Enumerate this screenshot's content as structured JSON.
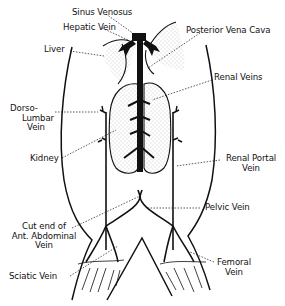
{
  "diagram": {
    "colors": {
      "ink": "#111111",
      "background": "#ffffff",
      "stipple": "#9a9a9a"
    },
    "labels": [
      {
        "id": "sinus-venosus",
        "lines": [
          "Sinus Venosus"
        ]
      },
      {
        "id": "hepatic-vein",
        "lines": [
          "Hepatic Vein"
        ]
      },
      {
        "id": "posterior-vena-cava",
        "lines": [
          "Posterior Vena Cava"
        ]
      },
      {
        "id": "liver",
        "lines": [
          "Liver"
        ]
      },
      {
        "id": "renal-veins",
        "lines": [
          "Renal Veins"
        ]
      },
      {
        "id": "dorso-lumbar-vein",
        "lines": [
          "Dorso-",
          "Lumbar",
          "Vein"
        ]
      },
      {
        "id": "kidney",
        "lines": [
          "Kidney"
        ]
      },
      {
        "id": "renal-portal-vein",
        "lines": [
          "Renal Portal",
          "Vein"
        ]
      },
      {
        "id": "pelvic-vein",
        "lines": [
          "Pelvic Vein"
        ]
      },
      {
        "id": "ant-abdominal-vein",
        "lines": [
          "Cut end of",
          "Ant. Abdominal",
          "Vein"
        ]
      },
      {
        "id": "sciatic-vein",
        "lines": [
          "Sciatic Vein"
        ]
      },
      {
        "id": "femoral-vein",
        "lines": [
          "Femoral",
          "Vein"
        ]
      }
    ]
  }
}
